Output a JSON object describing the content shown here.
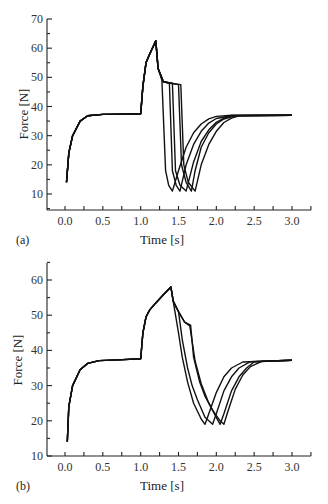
{
  "chart_data": [
    {
      "panel": "(a)",
      "type": "line",
      "title": "",
      "xlabel": "Time [s]",
      "ylabel": "Force [N]",
      "xlim": [
        -0.25,
        3.25
      ],
      "ylim": [
        5,
        70
      ],
      "xticks": [
        "0.0",
        "0.5",
        "1.0",
        "1.5",
        "2.0",
        "2.5",
        "3.0"
      ],
      "yticks": [
        "10",
        "20",
        "30",
        "40",
        "50",
        "60",
        "70"
      ],
      "grid": false,
      "legend": null,
      "series": [
        {
          "name": "curve 1",
          "x": [
            0.02,
            0.05,
            0.1,
            0.2,
            0.3,
            0.5,
            0.8,
            1.0,
            1.03,
            1.07,
            1.12,
            1.2,
            1.23,
            1.28,
            1.33,
            1.37,
            1.42,
            1.5,
            1.6,
            1.7,
            1.8,
            1.9,
            2.0,
            2.2,
            3.0
          ],
          "y": [
            14,
            24,
            30,
            35,
            36.8,
            37.3,
            37.4,
            37.5,
            47,
            55,
            58,
            62.5,
            53,
            49,
            18,
            13,
            11,
            18,
            26,
            31,
            34,
            35.8,
            36.6,
            37,
            37
          ]
        },
        {
          "name": "curve 2",
          "x": [
            0.02,
            0.05,
            0.1,
            0.2,
            0.3,
            0.5,
            0.8,
            1.0,
            1.03,
            1.07,
            1.12,
            1.2,
            1.23,
            1.3,
            1.38,
            1.42,
            1.47,
            1.52,
            1.6,
            1.7,
            1.8,
            1.9,
            2.0,
            2.2,
            3.0
          ],
          "y": [
            14,
            24,
            30,
            35,
            36.8,
            37.3,
            37.4,
            37.5,
            47,
            55,
            58,
            62.5,
            53,
            48.5,
            48,
            18,
            13,
            11,
            20,
            27,
            31.5,
            34.3,
            35.9,
            36.9,
            37
          ]
        },
        {
          "name": "curve 3",
          "x": [
            0.02,
            0.05,
            0.1,
            0.2,
            0.3,
            0.5,
            0.8,
            1.0,
            1.03,
            1.07,
            1.12,
            1.2,
            1.23,
            1.3,
            1.42,
            1.46,
            1.52,
            1.6,
            1.7,
            1.8,
            1.9,
            2.0,
            2.1,
            2.2,
            3.0
          ],
          "y": [
            14,
            24,
            30,
            35,
            36.8,
            37.3,
            37.4,
            37.5,
            47,
            55,
            58,
            62.5,
            53,
            48.5,
            48,
            18,
            13,
            11,
            21,
            28,
            32,
            34.6,
            36,
            36.8,
            37
          ]
        },
        {
          "name": "curve 4",
          "x": [
            0.02,
            0.05,
            0.1,
            0.2,
            0.3,
            0.5,
            0.8,
            1.0,
            1.03,
            1.07,
            1.12,
            1.2,
            1.23,
            1.3,
            1.4,
            1.5,
            1.54,
            1.6,
            1.67,
            1.72,
            1.8,
            1.9,
            2.0,
            2.1,
            2.25,
            3.0
          ],
          "y": [
            14,
            24,
            30,
            35,
            36.8,
            37.3,
            37.4,
            37.5,
            47,
            55,
            58,
            62.5,
            53,
            48.5,
            48,
            47.5,
            20,
            14,
            11,
            18,
            26,
            31,
            34,
            35.7,
            36.8,
            37
          ]
        },
        {
          "name": "curve 5",
          "x": [
            0.02,
            0.05,
            0.1,
            0.2,
            0.3,
            0.5,
            0.8,
            1.0,
            1.03,
            1.07,
            1.12,
            1.2,
            1.23,
            1.3,
            1.4,
            1.53,
            1.57,
            1.63,
            1.72,
            1.8,
            1.9,
            2.0,
            2.1,
            2.2,
            2.3,
            3.0
          ],
          "y": [
            14,
            24,
            30,
            35,
            36.8,
            37.3,
            37.4,
            37.5,
            47,
            55,
            58,
            62.5,
            53,
            48.5,
            48,
            47.5,
            20,
            14,
            11,
            20,
            27,
            31.5,
            34.5,
            36,
            36.8,
            37
          ]
        }
      ]
    },
    {
      "panel": "(b)",
      "type": "line",
      "title": "",
      "xlabel": "Time [s]",
      "ylabel": "Force [N]",
      "xlim": [
        -0.25,
        3.25
      ],
      "ylim": [
        10,
        65
      ],
      "xticks": [
        "0.0",
        "0.5",
        "1.0",
        "1.5",
        "2.0",
        "2.5",
        "3.0"
      ],
      "yticks": [
        "10",
        "20",
        "30",
        "40",
        "50",
        "60"
      ],
      "grid": false,
      "legend": null,
      "series": [
        {
          "name": "curve 1",
          "x": [
            0.03,
            0.05,
            0.1,
            0.2,
            0.3,
            0.45,
            0.7,
            1.0,
            1.03,
            1.07,
            1.12,
            1.2,
            1.3,
            1.4,
            1.43,
            1.5,
            1.55,
            1.62,
            1.7,
            1.8,
            1.85,
            1.9,
            2.0,
            2.1,
            2.2,
            2.35,
            3.0
          ],
          "y": [
            14,
            24,
            30,
            34.5,
            36.3,
            37.1,
            37.3,
            37.6,
            45,
            49.5,
            51.5,
            53.5,
            55.8,
            58,
            54,
            45,
            38,
            31,
            25,
            20.5,
            19,
            22,
            28,
            32.5,
            35,
            36.7,
            37.2
          ]
        },
        {
          "name": "curve 2",
          "x": [
            0.03,
            0.05,
            0.1,
            0.2,
            0.3,
            0.45,
            0.7,
            1.0,
            1.03,
            1.07,
            1.12,
            1.2,
            1.3,
            1.4,
            1.43,
            1.5,
            1.55,
            1.62,
            1.68,
            1.75,
            1.85,
            1.95,
            2.0,
            2.1,
            2.2,
            2.3,
            2.45,
            3.0
          ],
          "y": [
            14,
            24,
            30,
            34.5,
            36.3,
            37.1,
            37.3,
            37.6,
            45,
            49.5,
            51.5,
            53.5,
            55.8,
            58,
            54,
            51,
            43,
            35,
            30,
            26,
            21,
            19,
            22,
            28.5,
            32.5,
            35,
            36.8,
            37.2
          ]
        },
        {
          "name": "curve 3",
          "x": [
            0.03,
            0.05,
            0.1,
            0.2,
            0.3,
            0.45,
            0.7,
            1.0,
            1.03,
            1.07,
            1.12,
            1.2,
            1.3,
            1.4,
            1.43,
            1.5,
            1.58,
            1.65,
            1.72,
            1.8,
            1.9,
            2.0,
            2.05,
            2.1,
            2.2,
            2.3,
            2.4,
            2.5,
            3.0
          ],
          "y": [
            14,
            24,
            30,
            34.5,
            36.3,
            37.1,
            37.3,
            37.6,
            45,
            49.5,
            51.5,
            53.5,
            55.8,
            58,
            54,
            51,
            48,
            47,
            37,
            30.5,
            25,
            21,
            19,
            22,
            28.5,
            32.5,
            35,
            36.8,
            37.2
          ]
        },
        {
          "name": "curve 4",
          "x": [
            0.03,
            0.05,
            0.1,
            0.2,
            0.3,
            0.45,
            0.7,
            1.0,
            1.03,
            1.07,
            1.12,
            1.2,
            1.3,
            1.4,
            1.43,
            1.5,
            1.58,
            1.66,
            1.7,
            1.78,
            1.85,
            1.95,
            2.05,
            2.1,
            2.15,
            2.25,
            2.35,
            2.45,
            2.6,
            3.0
          ],
          "y": [
            14,
            24,
            30,
            34.5,
            36.3,
            37.1,
            37.3,
            37.6,
            45,
            49.5,
            51.5,
            53.5,
            55.8,
            58,
            54,
            51,
            48,
            47.2,
            38,
            31,
            27,
            23,
            20,
            19,
            22.5,
            29,
            33,
            35.4,
            36.9,
            37.2
          ]
        }
      ]
    }
  ],
  "panels": {
    "a": {
      "label": "(a)",
      "xlabel": "Time [s]",
      "ylabel": "Force [N]"
    },
    "b": {
      "label": "(b)",
      "xlabel": "Time [s]",
      "ylabel": "Force [N]"
    }
  }
}
